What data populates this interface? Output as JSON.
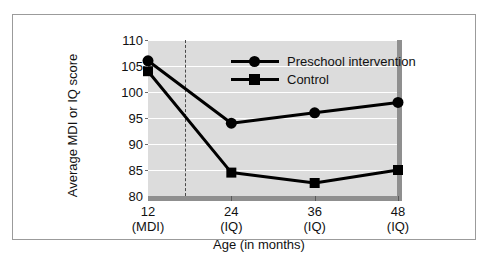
{
  "chart_data": {
    "type": "line",
    "title": "",
    "xlabel": "Age (in months)",
    "ylabel": "Average MDI or IQ score",
    "x": [
      12,
      24,
      36,
      48
    ],
    "categories": [
      "12",
      "24",
      "36",
      "48"
    ],
    "tick_units": [
      "(MDI)",
      "(IQ)",
      "(IQ)",
      "(IQ)"
    ],
    "xtick_labels": [
      "12",
      "24",
      "36",
      "48"
    ],
    "ytick_labels": [
      "80",
      "85",
      "90",
      "95",
      "100",
      "105",
      "110"
    ],
    "ytick_values": [
      80,
      85,
      90,
      95,
      100,
      105,
      110
    ],
    "ylim": [
      80,
      110
    ],
    "xlim": [
      12,
      48
    ],
    "grid": true,
    "grid_color": "#ffffff",
    "plot_background": "#dcdcdc",
    "legend_position": "top-center",
    "annotations": [
      {
        "type": "vertical-dashed-line",
        "x": 18,
        "label": ""
      }
    ],
    "series": [
      {
        "name": "Preschool intervention",
        "marker": "circle",
        "color": "#000000",
        "values": [
          106,
          94,
          96,
          98
        ]
      },
      {
        "name": "Control",
        "marker": "square",
        "color": "#000000",
        "values": [
          104,
          84.5,
          82.5,
          85
        ]
      }
    ]
  },
  "legend": {
    "items": [
      {
        "label": "Preschool intervention",
        "marker": "circle"
      },
      {
        "label": "Control",
        "marker": "square"
      }
    ]
  },
  "axes": {
    "y_title": "Average MDI or IQ score",
    "x_title": "Age (in months)"
  }
}
